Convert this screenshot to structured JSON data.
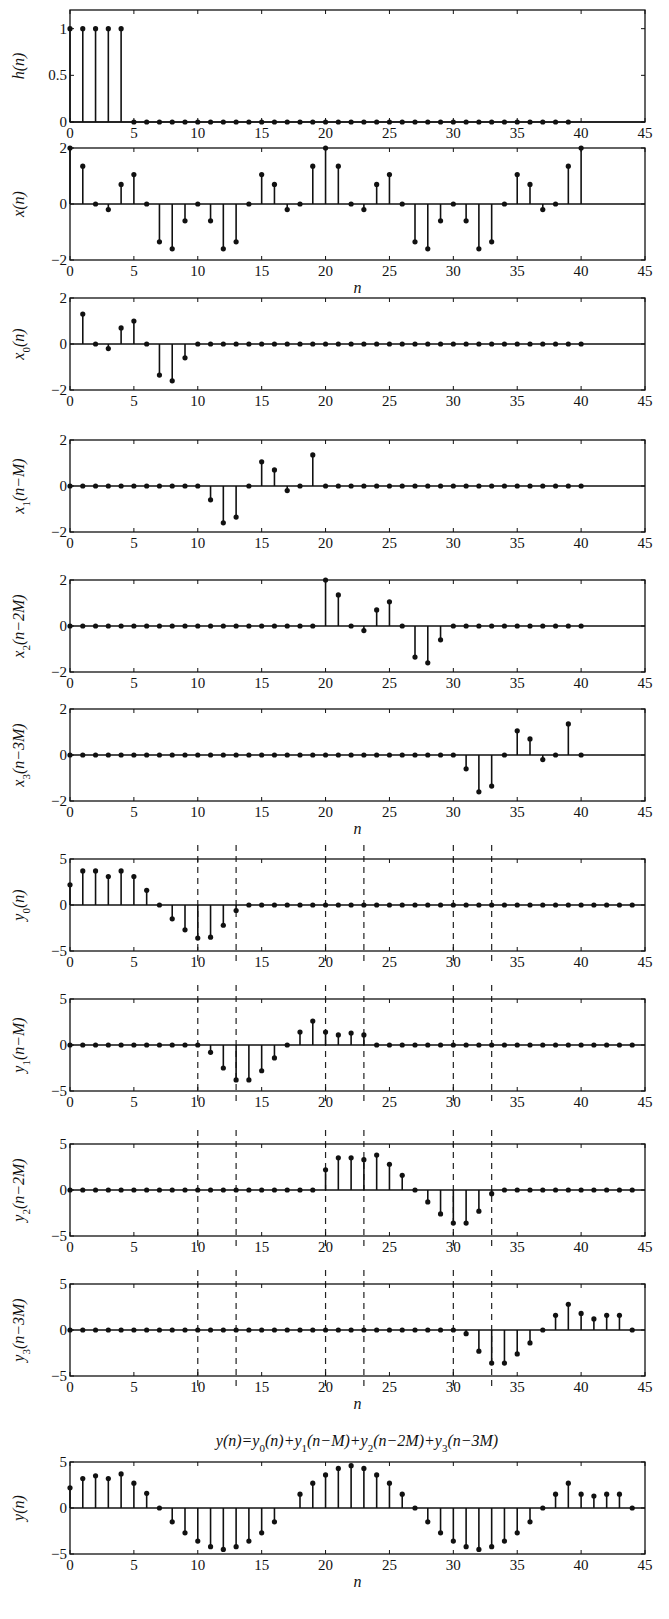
{
  "figure": {
    "formula_title": "y(n)=y0(n)+y1(n−M)+y2(n−2M)+y3(n−3M)",
    "x_axis_label": "n"
  },
  "chart_data": [
    {
      "type": "stem",
      "id": "h",
      "ylabel": "h(n)",
      "xlim": [
        0,
        45
      ],
      "ylim": [
        0,
        1.2
      ],
      "xticks": [
        0,
        5,
        10,
        15,
        20,
        25,
        30,
        35,
        40,
        45
      ],
      "yticks": [
        0,
        0.5,
        1
      ],
      "ytick_labels": [
        "0",
        "0.5",
        "1"
      ],
      "xlabel": "",
      "dashed_lines": [],
      "top": 10,
      "height": 112,
      "x": [
        0,
        1,
        2,
        3,
        4,
        5,
        6,
        7,
        8,
        9,
        10,
        11,
        12,
        13,
        14,
        15,
        16,
        17,
        18,
        19,
        20,
        21,
        22,
        23,
        24,
        25,
        26,
        27,
        28,
        29,
        30,
        31,
        32,
        33,
        34,
        35,
        36,
        37,
        38,
        39
      ],
      "values": [
        1,
        1,
        1,
        1,
        1,
        0,
        0,
        0,
        0,
        0,
        0,
        0,
        0,
        0,
        0,
        0,
        0,
        0,
        0,
        0,
        0,
        0,
        0,
        0,
        0,
        0,
        0,
        0,
        0,
        0,
        0,
        0,
        0,
        0,
        0,
        0,
        0,
        0,
        0,
        0
      ]
    },
    {
      "type": "stem",
      "id": "x",
      "ylabel": "x(n)",
      "xlim": [
        0,
        45
      ],
      "ylim": [
        -2,
        2
      ],
      "xticks": [
        0,
        5,
        10,
        15,
        20,
        25,
        30,
        35,
        40,
        45
      ],
      "yticks": [
        -2,
        0,
        2
      ],
      "ytick_labels": [
        "−2",
        "0",
        "2"
      ],
      "xlabel": "n",
      "dashed_lines": [],
      "top": 148,
      "height": 112,
      "x": [
        0,
        1,
        2,
        3,
        4,
        5,
        6,
        7,
        8,
        9,
        10,
        11,
        12,
        13,
        14,
        15,
        16,
        17,
        18,
        19,
        20,
        21,
        22,
        23,
        24,
        25,
        26,
        27,
        28,
        29,
        30,
        31,
        32,
        33,
        34,
        35,
        36,
        37,
        38,
        39,
        40
      ],
      "values": [
        2,
        1.35,
        0,
        -0.2,
        0.7,
        1.05,
        0,
        -1.35,
        -1.6,
        -0.6,
        0,
        -0.6,
        -1.6,
        -1.35,
        0,
        1.05,
        0.7,
        -0.2,
        0,
        1.35,
        2,
        1.35,
        0,
        -0.2,
        0.7,
        1.05,
        0,
        -1.35,
        -1.6,
        -0.6,
        0,
        -0.6,
        -1.6,
        -1.35,
        0,
        1.05,
        0.7,
        -0.2,
        0,
        1.35,
        2
      ]
    },
    {
      "type": "stem",
      "id": "x0",
      "ylabel": "x0(n)",
      "xlim": [
        0,
        45
      ],
      "ylim": [
        -2,
        2
      ],
      "xticks": [
        0,
        5,
        10,
        15,
        20,
        25,
        30,
        35,
        40,
        45
      ],
      "yticks": [
        -2,
        0,
        2
      ],
      "ytick_labels": [
        "−2",
        "0",
        "2"
      ],
      "xlabel": "",
      "dashed_lines": [],
      "top": 298,
      "height": 92,
      "x": [
        1,
        2,
        3,
        4,
        5,
        6,
        7,
        8,
        9,
        10,
        11,
        12,
        13,
        14,
        15,
        16,
        17,
        18,
        19,
        20,
        21,
        22,
        23,
        24,
        25,
        26,
        27,
        28,
        29,
        30,
        31,
        32,
        33,
        34,
        35,
        36,
        37,
        38,
        39,
        40
      ],
      "values": [
        1.3,
        0,
        -0.2,
        0.7,
        1.0,
        0,
        -1.35,
        -1.6,
        -0.6,
        0,
        0,
        0,
        0,
        0,
        0,
        0,
        0,
        0,
        0,
        0,
        0,
        0,
        0,
        0,
        0,
        0,
        0,
        0,
        0,
        0,
        0,
        0,
        0,
        0,
        0,
        0,
        0,
        0,
        0,
        0
      ]
    },
    {
      "type": "stem",
      "id": "x1",
      "ylabel": "x1(n−M)",
      "xlim": [
        0,
        45
      ],
      "ylim": [
        -2,
        2
      ],
      "xticks": [
        0,
        5,
        10,
        15,
        20,
        25,
        30,
        35,
        40,
        45
      ],
      "yticks": [
        -2,
        0,
        2
      ],
      "ytick_labels": [
        "−2",
        "0",
        "2"
      ],
      "xlabel": "",
      "dashed_lines": [],
      "top": 440,
      "height": 92,
      "x": [
        0,
        1,
        2,
        3,
        4,
        5,
        6,
        7,
        8,
        9,
        10,
        11,
        12,
        13,
        14,
        15,
        16,
        17,
        18,
        19,
        20,
        21,
        22,
        23,
        24,
        25,
        26,
        27,
        28,
        29,
        30,
        31,
        32,
        33,
        34,
        35,
        36,
        37,
        38,
        39,
        40
      ],
      "values": [
        0,
        0,
        0,
        0,
        0,
        0,
        0,
        0,
        0,
        0,
        0,
        -0.6,
        -1.6,
        -1.35,
        0,
        1.05,
        0.7,
        -0.2,
        0,
        1.35,
        0,
        0,
        0,
        0,
        0,
        0,
        0,
        0,
        0,
        0,
        0,
        0,
        0,
        0,
        0,
        0,
        0,
        0,
        0,
        0,
        0
      ]
    },
    {
      "type": "stem",
      "id": "x2",
      "ylabel": "x2(n−2M)",
      "xlim": [
        0,
        45
      ],
      "ylim": [
        -2,
        2
      ],
      "xticks": [
        0,
        5,
        10,
        15,
        20,
        25,
        30,
        35,
        40,
        45
      ],
      "yticks": [
        -2,
        0,
        2
      ],
      "ytick_labels": [
        "−2",
        "0",
        "2"
      ],
      "xlabel": "",
      "dashed_lines": [],
      "top": 580,
      "height": 92,
      "x": [
        0,
        1,
        2,
        3,
        4,
        5,
        6,
        7,
        8,
        9,
        10,
        11,
        12,
        13,
        14,
        15,
        16,
        17,
        18,
        19,
        20,
        21,
        22,
        23,
        24,
        25,
        26,
        27,
        28,
        29,
        30,
        31,
        32,
        33,
        34,
        35,
        36,
        37,
        38,
        39,
        40
      ],
      "values": [
        0,
        0,
        0,
        0,
        0,
        0,
        0,
        0,
        0,
        0,
        0,
        0,
        0,
        0,
        0,
        0,
        0,
        0,
        0,
        0,
        2,
        1.35,
        0,
        -0.2,
        0.7,
        1.05,
        0,
        -1.35,
        -1.6,
        -0.6,
        0,
        0,
        0,
        0,
        0,
        0,
        0,
        0,
        0,
        0,
        0
      ]
    },
    {
      "type": "stem",
      "id": "x3",
      "ylabel": "x3(n−3M)",
      "xlim": [
        0,
        45
      ],
      "ylim": [
        -2,
        2
      ],
      "xticks": [
        0,
        5,
        10,
        15,
        20,
        25,
        30,
        35,
        40,
        45
      ],
      "yticks": [
        -2,
        0,
        2
      ],
      "ytick_labels": [
        "−2",
        "0",
        "2"
      ],
      "xlabel": "n",
      "dashed_lines": [],
      "top": 709,
      "height": 92,
      "x": [
        0,
        1,
        2,
        3,
        4,
        5,
        6,
        7,
        8,
        9,
        10,
        11,
        12,
        13,
        14,
        15,
        16,
        17,
        18,
        19,
        20,
        21,
        22,
        23,
        24,
        25,
        26,
        27,
        28,
        29,
        30,
        31,
        32,
        33,
        34,
        35,
        36,
        37,
        38,
        39,
        40
      ],
      "values": [
        0,
        0,
        0,
        0,
        0,
        0,
        0,
        0,
        0,
        0,
        0,
        0,
        0,
        0,
        0,
        0,
        0,
        0,
        0,
        0,
        0,
        0,
        0,
        0,
        0,
        0,
        0,
        0,
        0,
        0,
        0,
        -0.6,
        -1.6,
        -1.35,
        0,
        1.05,
        0.7,
        -0.2,
        0,
        1.35,
        0
      ]
    },
    {
      "type": "stem",
      "id": "y0",
      "ylabel": "y0(n)",
      "xlim": [
        0,
        45
      ],
      "ylim": [
        -5,
        5
      ],
      "xticks": [
        0,
        5,
        10,
        15,
        20,
        25,
        30,
        35,
        40,
        45
      ],
      "yticks": [
        -5,
        0,
        5
      ],
      "ytick_labels": [
        "−5",
        "0",
        "5"
      ],
      "xlabel": "",
      "dashed_lines": [
        10,
        13,
        20,
        23,
        30,
        33
      ],
      "top": 859,
      "height": 92,
      "x": [
        0,
        1,
        2,
        3,
        4,
        5,
        6,
        7,
        8,
        9,
        10,
        11,
        12,
        13,
        14,
        15,
        16,
        17,
        18,
        19,
        20,
        21,
        22,
        23,
        24,
        25,
        26,
        27,
        28,
        29,
        30,
        31,
        32,
        33,
        34,
        35,
        36,
        37,
        38,
        39,
        40,
        41,
        42,
        43,
        44
      ],
      "values": [
        2.2,
        3.7,
        3.7,
        3.1,
        3.7,
        3.1,
        1.6,
        0,
        -1.5,
        -2.7,
        -3.6,
        -3.5,
        -2.2,
        -0.6,
        0,
        0,
        0,
        0,
        0,
        0,
        0,
        0,
        0,
        0,
        0,
        0,
        0,
        0,
        0,
        0,
        0,
        0,
        0,
        0,
        0,
        0,
        0,
        0,
        0,
        0,
        0,
        0,
        0,
        0,
        0
      ]
    },
    {
      "type": "stem",
      "id": "y1",
      "ylabel": "y1(n−M)",
      "xlim": [
        0,
        45
      ],
      "ylim": [
        -5,
        5
      ],
      "xticks": [
        0,
        5,
        10,
        15,
        20,
        25,
        30,
        35,
        40,
        45
      ],
      "yticks": [
        -5,
        0,
        5
      ],
      "ytick_labels": [
        "−5",
        "0",
        "5"
      ],
      "xlabel": "",
      "dashed_lines": [
        10,
        13,
        20,
        23,
        30,
        33
      ],
      "top": 999,
      "height": 92,
      "x": [
        0,
        1,
        2,
        3,
        4,
        5,
        6,
        7,
        8,
        9,
        10,
        11,
        12,
        13,
        14,
        15,
        16,
        17,
        18,
        19,
        20,
        21,
        22,
        23,
        24,
        25,
        26,
        27,
        28,
        29,
        30,
        31,
        32,
        33,
        34,
        35,
        36,
        37,
        38,
        39,
        40,
        41,
        42,
        43,
        44
      ],
      "values": [
        0,
        0,
        0,
        0,
        0,
        0,
        0,
        0,
        0,
        0,
        0,
        -0.8,
        -2.5,
        -3.8,
        -3.8,
        -2.8,
        -1.4,
        0,
        1.4,
        2.6,
        1.4,
        1.1,
        1.3,
        1.1,
        0,
        0,
        0,
        0,
        0,
        0,
        0,
        0,
        0,
        0,
        0,
        0,
        0,
        0,
        0,
        0,
        0,
        0,
        0,
        0,
        0
      ]
    },
    {
      "type": "stem",
      "id": "y2",
      "ylabel": "y2(n−2M)",
      "xlim": [
        0,
        45
      ],
      "ylim": [
        -5,
        5
      ],
      "xticks": [
        0,
        5,
        10,
        15,
        20,
        25,
        30,
        35,
        40,
        45
      ],
      "yticks": [
        -5,
        0,
        5
      ],
      "ytick_labels": [
        "−5",
        "0",
        "5"
      ],
      "xlabel": "",
      "dashed_lines": [
        10,
        13,
        20,
        23,
        30,
        33
      ],
      "top": 1144,
      "height": 92,
      "x": [
        0,
        1,
        2,
        3,
        4,
        5,
        6,
        7,
        8,
        9,
        10,
        11,
        12,
        13,
        14,
        15,
        16,
        17,
        18,
        19,
        20,
        21,
        22,
        23,
        24,
        25,
        26,
        27,
        28,
        29,
        30,
        31,
        32,
        33,
        34,
        35,
        36,
        37,
        38,
        39,
        40,
        41,
        42,
        43,
        44
      ],
      "values": [
        0,
        0,
        0,
        0,
        0,
        0,
        0,
        0,
        0,
        0,
        0,
        0,
        0,
        0,
        0,
        0,
        0,
        0,
        0,
        0,
        2.2,
        3.5,
        3.5,
        3.3,
        3.8,
        2.8,
        1.6,
        0,
        -1.3,
        -2.6,
        -3.6,
        -3.6,
        -2.3,
        -0.4,
        0,
        0,
        0,
        0,
        0,
        0,
        0,
        0,
        0,
        0,
        0
      ]
    },
    {
      "type": "stem",
      "id": "y3",
      "ylabel": "y3(n−3M)",
      "xlim": [
        0,
        45
      ],
      "ylim": [
        -5,
        5
      ],
      "xticks": [
        0,
        5,
        10,
        15,
        20,
        25,
        30,
        35,
        40,
        45
      ],
      "yticks": [
        -5,
        0,
        5
      ],
      "ytick_labels": [
        "−5",
        "0",
        "5"
      ],
      "xlabel": "n",
      "dashed_lines": [
        10,
        13,
        20,
        23,
        30,
        33
      ],
      "top": 1284,
      "height": 92,
      "x": [
        0,
        1,
        2,
        3,
        4,
        5,
        6,
        7,
        8,
        9,
        10,
        11,
        12,
        13,
        14,
        15,
        16,
        17,
        18,
        19,
        20,
        21,
        22,
        23,
        24,
        25,
        26,
        27,
        28,
        29,
        30,
        31,
        32,
        33,
        34,
        35,
        36,
        37,
        38,
        39,
        40,
        41,
        42,
        43,
        44
      ],
      "values": [
        0,
        0,
        0,
        0,
        0,
        0,
        0,
        0,
        0,
        0,
        0,
        0,
        0,
        0,
        0,
        0,
        0,
        0,
        0,
        0,
        0,
        0,
        0,
        0,
        0,
        0,
        0,
        0,
        0,
        0,
        0,
        -0.4,
        -2.3,
        -3.6,
        -3.6,
        -2.6,
        -1.4,
        0,
        1.6,
        2.8,
        1.8,
        1.2,
        1.6,
        1.6,
        0
      ]
    },
    {
      "type": "stem",
      "id": "y",
      "ylabel": "y(n)",
      "xlim": [
        0,
        45
      ],
      "ylim": [
        -5,
        5
      ],
      "xticks": [
        0,
        5,
        10,
        15,
        20,
        25,
        30,
        35,
        40,
        45
      ],
      "yticks": [
        -5,
        0,
        5
      ],
      "ytick_labels": [
        "−5",
        "0",
        "5"
      ],
      "xlabel": "n",
      "dashed_lines": [],
      "top": 1462,
      "height": 92,
      "x": [
        0,
        1,
        2,
        3,
        4,
        5,
        6,
        7,
        8,
        9,
        10,
        11,
        12,
        13,
        14,
        15,
        16,
        18,
        19,
        20,
        21,
        22,
        23,
        24,
        25,
        26,
        27,
        28,
        29,
        30,
        31,
        32,
        33,
        34,
        35,
        36,
        37,
        38,
        39,
        40,
        41,
        42,
        43,
        44
      ],
      "values": [
        2.2,
        3.2,
        3.5,
        3.2,
        3.7,
        2.7,
        1.6,
        0,
        -1.5,
        -2.7,
        -3.6,
        -4.2,
        -4.5,
        -4.2,
        -3.6,
        -2.7,
        -1.5,
        1.5,
        2.7,
        3.6,
        4.3,
        4.6,
        4.3,
        3.6,
        2.7,
        1.5,
        0,
        -1.5,
        -2.7,
        -3.6,
        -4.2,
        -4.5,
        -4.2,
        -3.6,
        -2.7,
        -1.5,
        0,
        1.5,
        2.7,
        1.5,
        1.3,
        1.5,
        1.5,
        0
      ]
    }
  ]
}
